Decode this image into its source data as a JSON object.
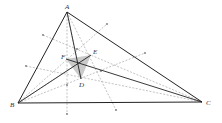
{
  "figure": {
    "type": "geometry-diagram",
    "points": {
      "A": {
        "label": "A",
        "x": 67,
        "y": 12
      },
      "B": {
        "label": "B",
        "x": 18,
        "y": 103
      },
      "C": {
        "label": "C",
        "x": 202,
        "y": 102
      },
      "D": {
        "label": "D",
        "x": 81,
        "y": 79
      },
      "E": {
        "label": "E",
        "x": 91,
        "y": 55
      },
      "F": {
        "label": "F",
        "x": 66,
        "y": 59
      },
      "O": {
        "label": "",
        "x": 78,
        "y": 63
      }
    },
    "labels": {
      "A": "A",
      "B": "B",
      "C": "C",
      "D": "D",
      "E": "E",
      "F": "F"
    },
    "colors": {
      "solid": "#222222",
      "dashed": "#9a9a9a",
      "shade": "#b8b8b8"
    }
  }
}
